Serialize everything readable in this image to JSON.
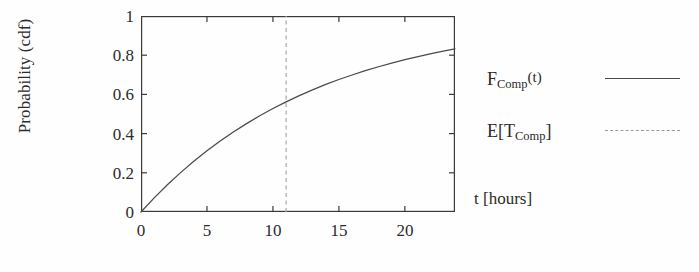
{
  "chart_data": {
    "type": "line",
    "title": "",
    "xlabel": "t [hours]",
    "ylabel": "Probability (cdf)",
    "xlim": [
      0,
      23.8
    ],
    "ylim": [
      0,
      1
    ],
    "xticks": [
      0,
      5,
      10,
      15,
      20
    ],
    "xtick_labels": [
      "0",
      "5",
      "10",
      "15",
      "20"
    ],
    "yticks": [
      0,
      0.2,
      0.4,
      0.6,
      0.8,
      1
    ],
    "ytick_labels": [
      "0",
      "0.2",
      "0.4",
      "0.6",
      "0.8",
      "1"
    ],
    "grid": false,
    "legend_position": "right",
    "series": [
      {
        "name": "F_Comp(t)",
        "style": "solid",
        "color": "#4a4a4a",
        "x": [
          0,
          1,
          2,
          3,
          4,
          5,
          6,
          7,
          8,
          9,
          10,
          11,
          12,
          13,
          14,
          15,
          16,
          17,
          18,
          19,
          20,
          21,
          22,
          23,
          23.8
        ],
        "y": [
          0.0,
          0.072,
          0.139,
          0.201,
          0.259,
          0.312,
          0.362,
          0.408,
          0.451,
          0.491,
          0.528,
          0.562,
          0.594,
          0.623,
          0.651,
          0.676,
          0.699,
          0.721,
          0.741,
          0.76,
          0.777,
          0.793,
          0.808,
          0.822,
          0.832
        ]
      },
      {
        "name": "E[T_Comp]",
        "style": "dashed",
        "color": "#9a9a9a",
        "type": "vline",
        "x_value": 11,
        "y_at_x": 0.562
      }
    ]
  },
  "axes": {
    "y_title": "Probability (cdf)",
    "x_title": "t [hours]"
  },
  "legend": {
    "items": [
      {
        "label_main": "F",
        "label_sub": "Comp",
        "label_tail": "(t)",
        "style": "solid"
      },
      {
        "label_main": "E[T",
        "label_sub": "Comp",
        "label_tail": "]",
        "style": "dashed"
      }
    ]
  }
}
